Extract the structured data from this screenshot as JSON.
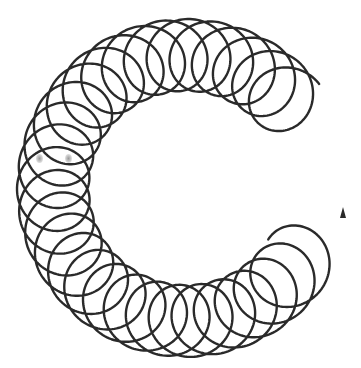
{
  "figure": {
    "stroke_color": "#2a2a2a",
    "background": "#ffffff",
    "stroke_width": 2.4
  },
  "coil": {
    "center": [
      186,
      188
    ],
    "arc_radius": 133,
    "loop_radius": 36,
    "start_angle_deg": -38,
    "end_angle_deg": 32,
    "direction": "counterclockwise-through-left",
    "loops": 28.5,
    "arrow_end": [
      343,
      212
    ]
  },
  "smudges": [
    [
      39,
      158
    ],
    [
      68,
      158
    ]
  ]
}
